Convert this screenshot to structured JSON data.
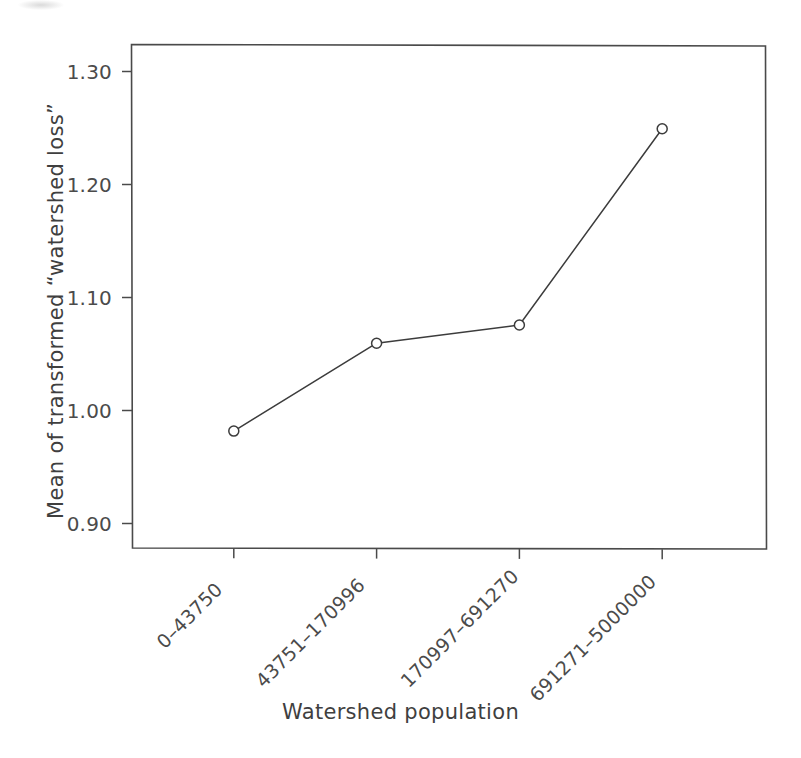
{
  "chart_data": {
    "type": "line",
    "title": "",
    "subtitle": "",
    "xlabel": "Watershed population",
    "ylabel": "Mean of transformed “watershed loss”",
    "categories": [
      "0–43750",
      "43751–170996",
      "170997–691270",
      "691271–5000000"
    ],
    "values": [
      0.974,
      1.056,
      1.073,
      1.256
    ],
    "series": [
      {
        "name": "Mean of transformed watershed loss",
        "values": [
          0.974,
          1.056,
          1.073,
          1.256
        ]
      }
    ],
    "ylim": [
      0.865,
      1.335
    ],
    "yticks": [
      0.9,
      1.0,
      1.1,
      1.2,
      1.3
    ],
    "ytick_labels": [
      "0.90",
      "1.00",
      "1.10",
      "1.20",
      "1.30"
    ],
    "xtick_labels": [
      "0–43750",
      "43751–170996",
      "170997–691270",
      "691271–5000000"
    ],
    "grid": false,
    "legend": false,
    "legend_position": "none",
    "marker": "open-circle",
    "line_color": "#3c3c3c",
    "marker_fill": "#ffffff",
    "background_color": "#ffffff",
    "axis_color": "#4a4a4a"
  },
  "axes": {
    "y_title": "Mean of transformed “watershed loss”",
    "x_title": "Watershed population"
  }
}
